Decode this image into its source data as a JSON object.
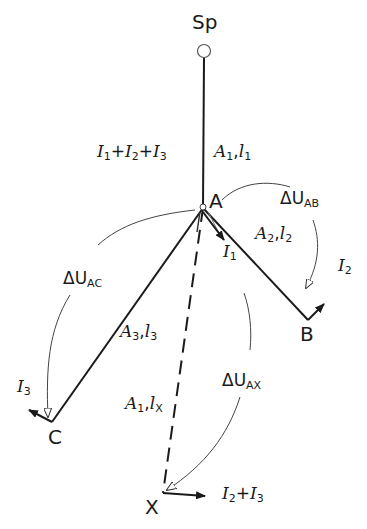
{
  "nodes": {
    "source": "Sp",
    "a": "A",
    "b": "B",
    "c": "C",
    "x": "X"
  },
  "labels": {
    "feed_current": {
      "i1": "I",
      "s1": "1",
      "plus1": "+",
      "i2": "I",
      "s2": "2",
      "plus2": "+",
      "i3": "I",
      "s3": "3"
    },
    "line_sp_a": {
      "a": "A",
      "as": "1",
      "sep": ",",
      "l": "l",
      "ls": "1"
    },
    "line_a_b": {
      "a": "A",
      "as": "2",
      "sep": ",",
      "l": "l",
      "ls": "2"
    },
    "line_a_c": {
      "a": "A",
      "as": "3",
      "sep": ",",
      "l": "l",
      "ls": "3"
    },
    "line_a_x": {
      "a": "A",
      "as": "1",
      "sep": ",",
      "l": "l",
      "ls": "X"
    },
    "du_ab": {
      "d": "ΔU",
      "s": "AB"
    },
    "du_ac": {
      "d": "ΔU",
      "s": "AC"
    },
    "du_ax": {
      "d": "ΔU",
      "s": "AX"
    },
    "current_i1": {
      "i": "I",
      "s": "1"
    },
    "current_i2": {
      "i": "I",
      "s": "2"
    },
    "current_i3": {
      "i": "I",
      "s": "3"
    },
    "current_x": {
      "i1": "I",
      "s1": "2",
      "plus": "+",
      "i2": "I",
      "s2": "3"
    }
  },
  "colors": {
    "ink": "#1a1a1a",
    "background": "#ffffff"
  }
}
